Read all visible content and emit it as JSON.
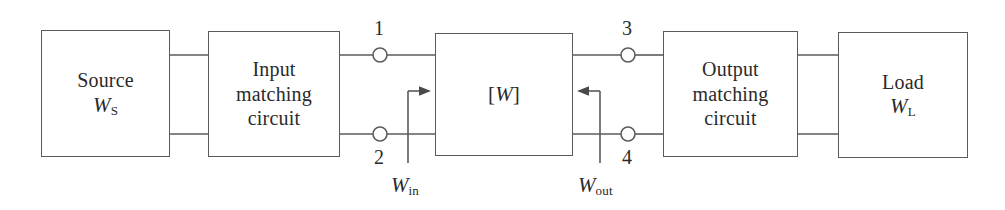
{
  "diagram": {
    "stroke_color": "#5b5b5b",
    "text_color": "#2a2a2a",
    "background_color": "#ffffff"
  },
  "blocks": [
    {
      "id": "source",
      "name": "source-block",
      "lines": [
        "Source"
      ],
      "symbol_base": "W",
      "symbol_sub": "S"
    },
    {
      "id": "input-matching",
      "name": "input-matching-circuit-block",
      "lines": [
        "Input",
        "matching",
        "circuit"
      ],
      "symbol_base": "",
      "symbol_sub": ""
    },
    {
      "id": "two-port",
      "name": "two-port-network-block",
      "lines": [],
      "symbol_base": "W",
      "symbol_sub": ""
    },
    {
      "id": "output-matching",
      "name": "output-matching-circuit-block",
      "lines": [
        "Output",
        "matching",
        "circuit"
      ],
      "symbol_base": "",
      "symbol_sub": ""
    },
    {
      "id": "load",
      "name": "load-block",
      "lines": [
        "Load"
      ],
      "symbol_base": "W",
      "symbol_sub": "L"
    }
  ],
  "two_port_label": {
    "open_bracket": "[",
    "base": "W",
    "close_bracket": "]"
  },
  "ports": [
    {
      "id": "port-1",
      "label": "1",
      "position": "top-left"
    },
    {
      "id": "port-2",
      "label": "2",
      "position": "bottom-left"
    },
    {
      "id": "port-3",
      "label": "3",
      "position": "top-right"
    },
    {
      "id": "port-4",
      "label": "4",
      "position": "bottom-right"
    }
  ],
  "flow_markers": [
    {
      "id": "gamma-in",
      "base": "W",
      "sub": "in",
      "arrow_direction": "right"
    },
    {
      "id": "gamma-out",
      "base": "W",
      "sub": "out",
      "arrow_direction": "left"
    }
  ]
}
